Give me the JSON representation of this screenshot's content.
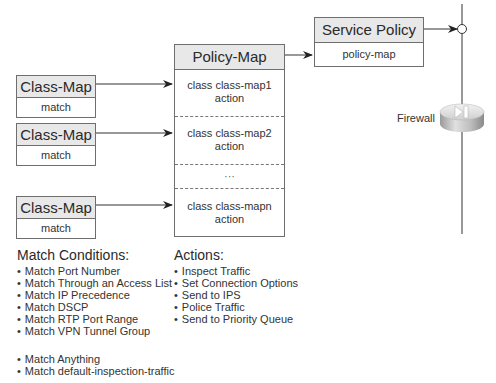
{
  "class_maps": [
    {
      "title": "Class-Map",
      "body": "match"
    },
    {
      "title": "Class-Map",
      "body": "match"
    },
    {
      "title": "Class-Map",
      "body": "match"
    }
  ],
  "policy_map": {
    "title": "Policy-Map",
    "sections": [
      {
        "line1": "class class-map1",
        "line2": "action"
      },
      {
        "line1": "class class-map2",
        "line2": "action"
      },
      {
        "line1": "···",
        "line2": ""
      },
      {
        "line1": "class class-mapn",
        "line2": "action"
      }
    ]
  },
  "service_policy": {
    "title": "Service Policy",
    "body": "policy-map"
  },
  "firewall": {
    "label": "Firewall",
    "icon": "firewall-icon"
  },
  "match_conditions": {
    "title": "Match Conditions:",
    "items": [
      "Match Port Number",
      "Match Through an Access List",
      "Match IP Precedence",
      "Match DSCP",
      "Match RTP  Port Range",
      "Match VPN Tunnel Group"
    ],
    "extra_items": [
      "Match Anything",
      "Match default-inspection-traffic"
    ]
  },
  "actions": {
    "title": "Actions:",
    "items": [
      "Inspect Traffic",
      "Set Connection Options",
      "Send to IPS",
      "Police Traffic",
      "Send to Priority Queue"
    ]
  },
  "colors": {
    "header_fill": "#e8e8e8",
    "border": "#6e6e6e",
    "line": "#333333"
  }
}
